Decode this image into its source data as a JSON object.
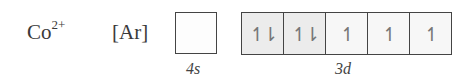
{
  "ion": {
    "symbol": "Co",
    "charge": "2+"
  },
  "core": "[Ar]",
  "orbitals": {
    "s": {
      "label": "4s",
      "electrons": ""
    },
    "d": {
      "label": "3d",
      "cells": [
        "↿⇂",
        "↿⇂",
        "↿",
        "↿",
        "↿"
      ]
    }
  },
  "colors": {
    "paired_fill": "#ececec",
    "unpaired_fill": "#f7f7f7",
    "border": "#444444"
  }
}
